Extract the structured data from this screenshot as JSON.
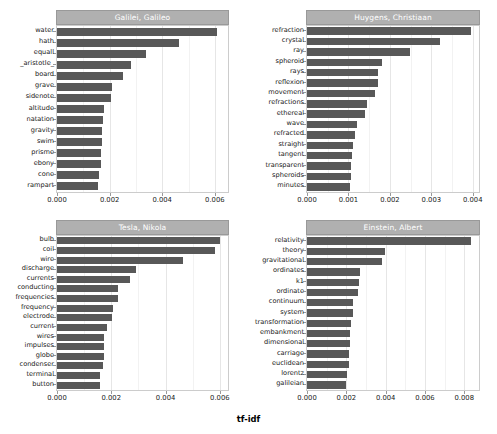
{
  "figure": {
    "xlabel": "tf-idf",
    "bar_color": "#585858",
    "title_bar_color": "#b0b0b0",
    "background": "#ffffff",
    "grid_color": "#e6e6e6"
  },
  "chart_data": [
    {
      "type": "bar",
      "orientation": "horizontal",
      "title": "Galilei, Galileo",
      "xlabel": "tf-idf",
      "ylabel": "",
      "xlim": [
        0,
        0.0065
      ],
      "xticks": [
        0.0,
        0.002,
        0.004,
        0.006
      ],
      "xticklabels": [
        "0.000",
        "0.002",
        "0.004",
        "0.006"
      ],
      "grid": true,
      "categories": [
        "water",
        "hath",
        "equall",
        "_aristotle_",
        "board",
        "grave",
        "sidenote",
        "altitude",
        "natation",
        "gravity",
        "swim",
        "prisme",
        "ebony",
        "cone",
        "rampart"
      ],
      "values": [
        0.0061,
        0.00462,
        0.00338,
        0.00281,
        0.00251,
        0.00209,
        0.00207,
        0.0018,
        0.00175,
        0.00172,
        0.00171,
        0.00168,
        0.00166,
        0.00158,
        0.00156
      ]
    },
    {
      "type": "bar",
      "orientation": "horizontal",
      "title": "Huygens, Christiaan",
      "xlabel": "tf-idf",
      "ylabel": "",
      "xlim": [
        0,
        0.00415
      ],
      "xticks": [
        0.0,
        0.001,
        0.002,
        0.003,
        0.004
      ],
      "xticklabels": [
        "0.000",
        "0.001",
        "0.002",
        "0.003",
        "0.004"
      ],
      "grid": true,
      "categories": [
        "refraction",
        "crystal",
        "ray",
        "spheroid",
        "rays",
        "reflexion",
        "movement",
        "refractions",
        "ethereal",
        "wave",
        "refracted",
        "straight",
        "tangent",
        "transparent",
        "spheroids",
        "minutes"
      ],
      "values": [
        0.00395,
        0.00322,
        0.00248,
        0.0018,
        0.00172,
        0.00171,
        0.00165,
        0.00145,
        0.00139,
        0.0012,
        0.00117,
        0.0011,
        0.00108,
        0.00106,
        0.00105,
        0.00104
      ]
    },
    {
      "type": "bar",
      "orientation": "horizontal",
      "title": "Tesla, Nikola",
      "xlabel": "tf-idf",
      "ylabel": "",
      "xlim": [
        0,
        0.0063
      ],
      "xticks": [
        0.0,
        0.002,
        0.004,
        0.006
      ],
      "xticklabels": [
        "0.000",
        "0.002",
        "0.004",
        "0.006"
      ],
      "grid": true,
      "categories": [
        "bulb",
        "coil",
        "wire",
        "discharge",
        "currents",
        "conducting",
        "frequencies",
        "frequency",
        "electrode",
        "current",
        "wires",
        "impulses",
        "globe",
        "condenser",
        "terminal",
        "button"
      ],
      "values": [
        0.00601,
        0.00582,
        0.00466,
        0.00291,
        0.00268,
        0.00226,
        0.00224,
        0.00208,
        0.00203,
        0.00186,
        0.00174,
        0.00172,
        0.00172,
        0.00171,
        0.00158,
        0.00157
      ]
    },
    {
      "type": "bar",
      "orientation": "horizontal",
      "title": "Einstein, Albert",
      "xlabel": "tf-idf",
      "ylabel": "",
      "xlim": [
        0,
        0.00875
      ],
      "xticks": [
        0.0,
        0.002,
        0.004,
        0.006,
        0.008
      ],
      "xticklabels": [
        "0.000",
        "0.002",
        "0.004",
        "0.006",
        "0.008"
      ],
      "grid": true,
      "categories": [
        "relativity",
        "theory",
        "gravitational",
        "ordinates",
        "k1",
        "ordinate",
        "continuum",
        "system",
        "transformation",
        "embankment",
        "dimensional",
        "carriage",
        "euclidean",
        "lorentz",
        "galileian"
      ],
      "values": [
        0.00835,
        0.00395,
        0.00381,
        0.00272,
        0.00262,
        0.00257,
        0.00235,
        0.00233,
        0.00222,
        0.00221,
        0.00219,
        0.00216,
        0.00212,
        0.00205,
        0.00198
      ]
    }
  ]
}
